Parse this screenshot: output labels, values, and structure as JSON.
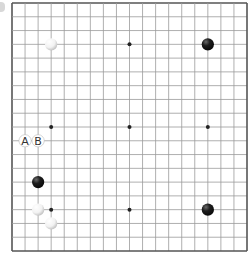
{
  "board": {
    "size": 19,
    "origin_x": 12,
    "origin_y": 3,
    "width": 235,
    "height": 248,
    "line_color": "#9a9a9a",
    "border_color": "#555555",
    "star_points": [
      [
        3,
        3
      ],
      [
        9,
        3
      ],
      [
        15,
        3
      ],
      [
        3,
        9
      ],
      [
        9,
        9
      ],
      [
        15,
        9
      ],
      [
        3,
        15
      ],
      [
        9,
        15
      ],
      [
        15,
        15
      ]
    ],
    "stones": [
      {
        "color": "white",
        "col": 3,
        "row": 3
      },
      {
        "color": "black",
        "col": 15,
        "row": 3
      },
      {
        "color": "black",
        "col": 2,
        "row": 13
      },
      {
        "color": "white",
        "col": 2,
        "row": 15
      },
      {
        "color": "white",
        "col": 3,
        "row": 16
      },
      {
        "color": "black",
        "col": 15,
        "row": 15
      }
    ],
    "labels": [
      {
        "text": "A",
        "col": 1,
        "row": 10
      },
      {
        "text": "B",
        "col": 2,
        "row": 10
      }
    ]
  }
}
